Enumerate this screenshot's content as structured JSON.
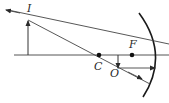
{
  "diagram": {
    "type": "concave-mirror-ray-diagram",
    "labels": {
      "image": "I",
      "object": "O",
      "center_of_curvature": "C",
      "focal_point": "F"
    },
    "colors": {
      "line": "#3a3a3a",
      "mirror": "#1a1a1a",
      "background": "#ffffff"
    }
  }
}
